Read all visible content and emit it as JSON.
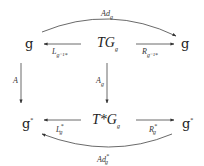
{
  "diagram": {
    "nodes": {
      "top_left": {
        "base": "g",
        "sup": ""
      },
      "top_center": {
        "base": "TG",
        "sub": "g"
      },
      "top_right": {
        "base": "g",
        "sup": ""
      },
      "bottom_left": {
        "base": "g",
        "sup": "*"
      },
      "bottom_center": {
        "base": "T*G",
        "sub": "g"
      },
      "bottom_right": {
        "base": "g",
        "sup": "*"
      }
    },
    "arrows": {
      "ad_top": {
        "base": "Ad",
        "sub": "g",
        "sup": ""
      },
      "left_top": {
        "base": "L",
        "sub": "g⁻¹*",
        "sup": ""
      },
      "right_top": {
        "base": "R",
        "sub": "g⁻¹*",
        "sup": ""
      },
      "left_vertical": {
        "base": "A",
        "sub": "",
        "sup": ""
      },
      "center_vertical": {
        "base": "A",
        "sub": "g",
        "sup": ""
      },
      "left_bottom": {
        "base": "L",
        "sub": "g",
        "sup": "*"
      },
      "right_bottom": {
        "base": "R",
        "sub": "g",
        "sup": "*"
      },
      "ad_bottom": {
        "base": "Ad",
        "sub": "g",
        "sup": "*"
      }
    }
  }
}
